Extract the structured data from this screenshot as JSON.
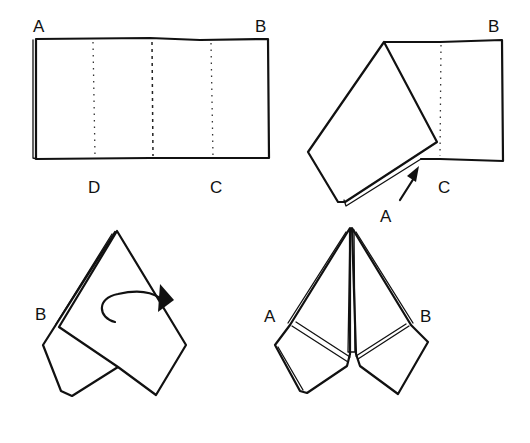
{
  "diagram": {
    "steps": [
      {
        "id": "step-1",
        "description": "Napkin folded into a rectangle with fold lines",
        "labels": {
          "top_left": "A",
          "top_right": "B",
          "bottom_left": "D",
          "bottom_right": "C"
        }
      },
      {
        "id": "step-2",
        "description": "Corner A folded down to point C",
        "labels": {
          "top_right": "B",
          "bottom_right": "C",
          "arrow_target": "A"
        }
      },
      {
        "id": "step-3",
        "description": "Fold point with curved arrow indicating turn over",
        "labels": {
          "left": "B"
        }
      },
      {
        "id": "step-4",
        "description": "Finished fold with two points",
        "labels": {
          "left": "A",
          "right": "B"
        }
      }
    ],
    "colors": {
      "ink": "#111111",
      "background": "#ffffff"
    }
  }
}
